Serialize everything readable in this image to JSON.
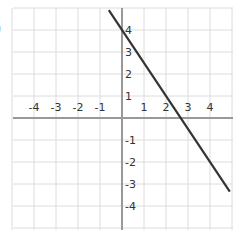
{
  "problem_label": ")",
  "chart_data": {
    "type": "line",
    "title": "",
    "xlabel": "",
    "ylabel": "",
    "xlim": [
      -5,
      5
    ],
    "ylim": [
      -5,
      5
    ],
    "grid": true,
    "x_ticks": [
      -4,
      -3,
      -2,
      -1,
      1,
      2,
      3,
      4
    ],
    "y_ticks": [
      4,
      3,
      2,
      1,
      -1,
      -2,
      -3,
      -4
    ],
    "series": [
      {
        "name": "line",
        "equation": "y = -1.5x + 4",
        "slope": -1.5,
        "y_intercept": 4,
        "x_intercept": 2.67,
        "x": [
          -0.6,
          4.9
        ],
        "y": [
          4.9,
          -3.35
        ],
        "color": "#333333"
      }
    ]
  },
  "colors": {
    "grid": "#dcdcdc",
    "axis": "#999999",
    "line": "#333333",
    "label": "#333333"
  }
}
